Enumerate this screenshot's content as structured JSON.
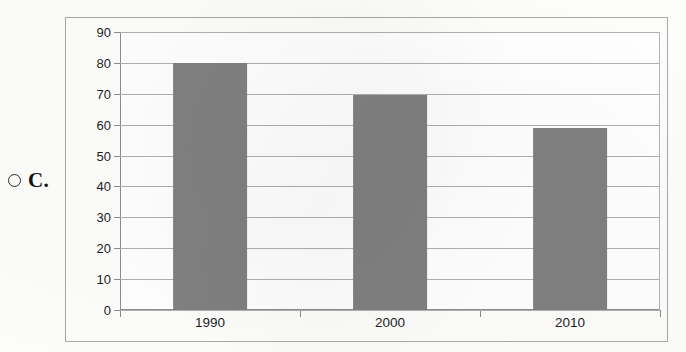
{
  "option": {
    "letter": "C.",
    "radio_icon": "radio-unselected-icon",
    "selected": false
  },
  "chart_data": {
    "type": "bar",
    "title": "",
    "subtitle": "",
    "xlabel": "",
    "ylabel": "",
    "categories": [
      "1990",
      "2000",
      "2010"
    ],
    "values": [
      80,
      69.5,
      59
    ],
    "series": [
      {
        "name": "",
        "values": [
          80,
          69.5,
          59
        ]
      }
    ],
    "ylim": [
      0,
      90
    ],
    "ytick_step": 10,
    "yticks": [
      90,
      80,
      70,
      60,
      50,
      40,
      30,
      20,
      10,
      0
    ],
    "xticks": [
      "1990",
      "2000",
      "2010"
    ],
    "grid": true,
    "grid_axis": "y",
    "legend": false,
    "legend_position": "none",
    "bar_color": "#808080",
    "plot_background": "#ffffff",
    "gridline_color": "#b0b0b0",
    "axis_color": "#8c8c8c",
    "frame_color": "#a9a9a9",
    "annotations": []
  }
}
